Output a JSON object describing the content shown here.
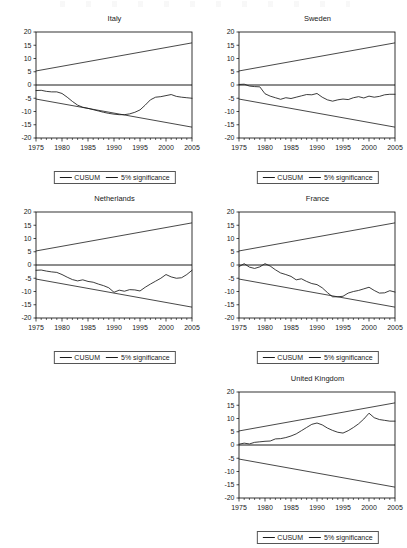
{
  "figure": {
    "panel_width": 203,
    "panel_height": 180,
    "legend": {
      "cusum_label": "CUSUM",
      "significance_label": "5% significance"
    }
  },
  "chart_data": [
    {
      "type": "line",
      "title": "Italy",
      "xlabel": "",
      "ylabel": "",
      "xlim": [
        1975,
        2005
      ],
      "ylim": [
        -20,
        20
      ],
      "xticks": [
        1975,
        1980,
        1985,
        1990,
        1995,
        2000,
        2005
      ],
      "yticks": [
        20,
        15,
        10,
        5,
        0,
        -5,
        -10,
        -15,
        -20
      ],
      "grid": false,
      "legend_position": "below",
      "series": [
        {
          "name": "CUSUM",
          "x": [
            1975,
            1976,
            1977,
            1978,
            1979,
            1980,
            1981,
            1982,
            1983,
            1984,
            1985,
            1986,
            1987,
            1988,
            1989,
            1990,
            1991,
            1992,
            1993,
            1994,
            1995,
            1996,
            1997,
            1998,
            1999,
            2000,
            2001,
            2002,
            2003,
            2004,
            2005
          ],
          "values": [
            -2.1,
            -2.0,
            -2.4,
            -2.6,
            -2.6,
            -3.2,
            -4.6,
            -6.2,
            -7.6,
            -8.4,
            -8.8,
            -9.3,
            -9.8,
            -10.3,
            -10.7,
            -11.0,
            -11.2,
            -11.2,
            -10.9,
            -10.3,
            -9.4,
            -7.6,
            -5.6,
            -4.6,
            -4.4,
            -4.0,
            -3.6,
            -4.3,
            -4.6,
            -4.8,
            -5.0
          ]
        },
        {
          "name": "5% significance upper",
          "x": [
            1975,
            2005
          ],
          "values": [
            5.3,
            15.9
          ]
        },
        {
          "name": "5% significance lower",
          "x": [
            1975,
            2005
          ],
          "values": [
            -5.3,
            -15.9
          ]
        }
      ]
    },
    {
      "type": "line",
      "title": "Sweden",
      "xlabel": "",
      "ylabel": "",
      "xlim": [
        1975,
        2005
      ],
      "ylim": [
        -20,
        20
      ],
      "xticks": [
        1975,
        1980,
        1985,
        1990,
        1995,
        2000,
        2005
      ],
      "yticks": [
        20,
        15,
        10,
        5,
        0,
        -5,
        -10,
        -15,
        -20
      ],
      "grid": false,
      "legend_position": "below",
      "series": [
        {
          "name": "CUSUM",
          "x": [
            1975,
            1976,
            1977,
            1978,
            1979,
            1980,
            1981,
            1982,
            1983,
            1984,
            1985,
            1986,
            1987,
            1988,
            1989,
            1990,
            1991,
            1992,
            1993,
            1994,
            1995,
            1996,
            1997,
            1998,
            1999,
            2000,
            2001,
            2002,
            2003,
            2004,
            2005
          ],
          "values": [
            0.2,
            0.3,
            -0.4,
            -0.6,
            -0.7,
            -3.3,
            -4.2,
            -4.8,
            -5.4,
            -4.8,
            -5.1,
            -4.6,
            -4.1,
            -3.6,
            -3.7,
            -3.2,
            -4.6,
            -5.6,
            -6.1,
            -5.6,
            -5.3,
            -5.5,
            -4.8,
            -4.4,
            -4.9,
            -4.2,
            -4.6,
            -4.3,
            -3.7,
            -3.5,
            -3.5
          ]
        },
        {
          "name": "5% significance upper",
          "x": [
            1975,
            2005
          ],
          "values": [
            5.3,
            15.9
          ]
        },
        {
          "name": "5% significance lower",
          "x": [
            1975,
            2005
          ],
          "values": [
            -5.3,
            -15.9
          ]
        }
      ]
    },
    {
      "type": "line",
      "title": "Netherlands",
      "xlabel": "",
      "ylabel": "",
      "xlim": [
        1975,
        2005
      ],
      "ylim": [
        -20,
        20
      ],
      "xticks": [
        1975,
        1980,
        1985,
        1990,
        1995,
        2000,
        2005
      ],
      "yticks": [
        20,
        15,
        10,
        5,
        0,
        -5,
        -10,
        -15,
        -20
      ],
      "grid": false,
      "legend_position": "below",
      "series": [
        {
          "name": "CUSUM",
          "x": [
            1975,
            1976,
            1977,
            1978,
            1979,
            1980,
            1981,
            1982,
            1983,
            1984,
            1985,
            1986,
            1987,
            1988,
            1989,
            1990,
            1991,
            1992,
            1993,
            1994,
            1995,
            1996,
            1997,
            1998,
            1999,
            2000,
            2001,
            2002,
            2003,
            2004,
            2005
          ],
          "values": [
            -2.0,
            -1.9,
            -2.3,
            -2.6,
            -2.8,
            -3.6,
            -4.6,
            -5.5,
            -6.0,
            -5.6,
            -6.2,
            -6.5,
            -7.2,
            -7.8,
            -8.6,
            -10.3,
            -9.5,
            -9.9,
            -9.3,
            -9.4,
            -9.8,
            -8.4,
            -7.2,
            -6.1,
            -5.0,
            -3.6,
            -4.5,
            -5.0,
            -4.8,
            -3.6,
            -2.0
          ]
        },
        {
          "name": "5% significance upper",
          "x": [
            1975,
            2005
          ],
          "values": [
            5.3,
            15.9
          ]
        },
        {
          "name": "5% significance lower",
          "x": [
            1975,
            2005
          ],
          "values": [
            -5.3,
            -15.9
          ]
        }
      ]
    },
    {
      "type": "line",
      "title": "France",
      "xlabel": "",
      "ylabel": "",
      "xlim": [
        1975,
        2005
      ],
      "ylim": [
        -20,
        20
      ],
      "xticks": [
        1975,
        1980,
        1985,
        1990,
        1995,
        2000,
        2005
      ],
      "yticks": [
        20,
        15,
        10,
        5,
        0,
        -5,
        -10,
        -15,
        -20
      ],
      "grid": false,
      "legend_position": "below",
      "series": [
        {
          "name": "CUSUM",
          "x": [
            1975,
            1976,
            1977,
            1978,
            1979,
            1980,
            1981,
            1982,
            1983,
            1984,
            1985,
            1986,
            1987,
            1988,
            1989,
            1990,
            1991,
            1992,
            1993,
            1994,
            1995,
            1996,
            1997,
            1998,
            1999,
            2000,
            2001,
            2002,
            2003,
            2004,
            2005
          ],
          "values": [
            -0.6,
            0.5,
            -0.8,
            -1.3,
            -0.7,
            0.5,
            -0.4,
            -1.8,
            -3.0,
            -3.6,
            -4.3,
            -5.6,
            -5.2,
            -6.2,
            -7.0,
            -7.4,
            -8.6,
            -10.4,
            -12.0,
            -12.0,
            -11.8,
            -10.6,
            -10.0,
            -9.6,
            -9.0,
            -8.4,
            -9.6,
            -10.6,
            -10.5,
            -9.7,
            -10.2
          ]
        },
        {
          "name": "5% significance upper",
          "x": [
            1975,
            2005
          ],
          "values": [
            5.3,
            15.9
          ]
        },
        {
          "name": "5% significance lower",
          "x": [
            1975,
            2005
          ],
          "values": [
            -5.3,
            -15.9
          ]
        }
      ]
    },
    {
      "type": "line",
      "title": "United Kingdom",
      "xlabel": "",
      "ylabel": "",
      "xlim": [
        1975,
        2005
      ],
      "ylim": [
        -20,
        20
      ],
      "xticks": [
        1975,
        1980,
        1985,
        1990,
        1995,
        2000,
        2005
      ],
      "yticks": [
        20,
        15,
        10,
        5,
        0,
        -5,
        -10,
        -15,
        -20
      ],
      "grid": false,
      "legend_position": "below",
      "series": [
        {
          "name": "CUSUM",
          "x": [
            1975,
            1976,
            1977,
            1978,
            1979,
            1980,
            1981,
            1982,
            1983,
            1984,
            1985,
            1986,
            1987,
            1988,
            1989,
            1990,
            1991,
            1992,
            1993,
            1994,
            1995,
            1996,
            1997,
            1998,
            1999,
            2000,
            2001,
            2002,
            2003,
            2004,
            2005
          ],
          "values": [
            0.3,
            0.7,
            0.4,
            1.0,
            1.2,
            1.4,
            1.5,
            2.3,
            2.4,
            2.8,
            3.4,
            4.2,
            5.4,
            6.6,
            7.8,
            8.3,
            7.6,
            6.4,
            5.5,
            4.8,
            4.5,
            5.4,
            6.6,
            8.0,
            9.8,
            12.0,
            10.3,
            9.6,
            9.3,
            9.0,
            9.0
          ]
        },
        {
          "name": "5% significance upper",
          "x": [
            1975,
            2005
          ],
          "values": [
            5.3,
            15.9
          ]
        },
        {
          "name": "5% significance lower",
          "x": [
            1975,
            2005
          ],
          "values": [
            -5.3,
            -15.9
          ]
        }
      ]
    }
  ]
}
